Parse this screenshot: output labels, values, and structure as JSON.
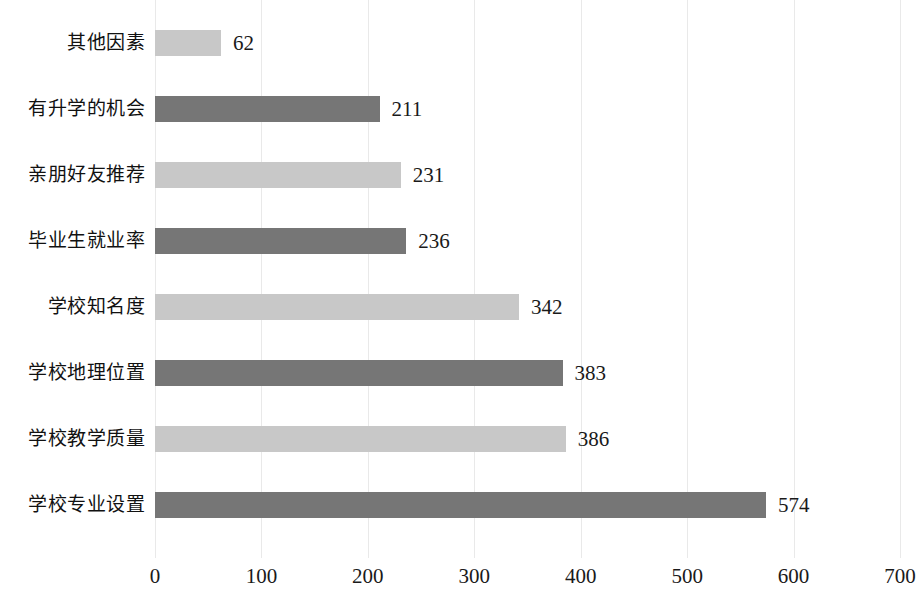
{
  "chart_data": {
    "type": "bar",
    "orientation": "horizontal",
    "title": "",
    "subtitle": "",
    "xlabel": "",
    "ylabel": "",
    "xlim": [
      0,
      700
    ],
    "xticks": [
      "0",
      "100",
      "200",
      "300",
      "400",
      "500",
      "600",
      "700"
    ],
    "xtick_values": [
      0,
      100,
      200,
      300,
      400,
      500,
      600,
      700
    ],
    "grid": true,
    "grid_axis": "x",
    "legend": "none",
    "categories": [
      "其他因素",
      "有升学的机会",
      "亲朋好友推荐",
      "毕业生就业率",
      "学校知名度",
      "学校地理位置",
      "学校教学质量",
      "学校专业设置"
    ],
    "values": [
      62,
      211,
      231,
      236,
      342,
      383,
      386,
      574
    ],
    "value_labels": [
      "62",
      "211",
      "231",
      "236",
      "342",
      "383",
      "386",
      "574"
    ],
    "bar_colors": [
      "#c8c8c8",
      "#767676",
      "#c8c8c8",
      "#767676",
      "#c8c8c8",
      "#767676",
      "#c8c8c8",
      "#767676"
    ],
    "colors": {
      "light_bar": "#c8c8c8",
      "dark_bar": "#767676",
      "gridline": "#e9e9e9",
      "text": "#1a1a1a",
      "background": "#ffffff"
    }
  }
}
